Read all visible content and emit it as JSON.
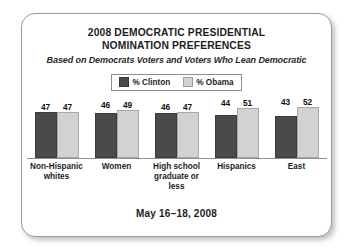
{
  "card": {
    "title_lines": [
      "2008 DEMOCRATIC PRESIDENTIAL",
      "NOMINATION PREFERENCES"
    ],
    "subtitle": "Based on Democrats Voters and Voters Who Lean Democratic",
    "footer": "May 16–18, 2008"
  },
  "legend": {
    "items": [
      {
        "label": "% Clinton",
        "color": "#4a4a4a",
        "swatch": "clinton-swatch"
      },
      {
        "label": "% Obama",
        "color": "#d2d2d2",
        "swatch": "obama-swatch"
      }
    ]
  },
  "colors": {
    "clinton": "#4a4a4a",
    "obama": "#d2d2d2",
    "axis": "#8f8f8f",
    "card_border": "#9a9a9a",
    "background": "#ffffff",
    "text": "#1d1d1d"
  },
  "chart_data": {
    "type": "bar",
    "title": "2008 DEMOCRATIC PRESIDENTIAL NOMINATION PREFERENCES",
    "subtitle": "Based on Democrats Voters and Voters Who Lean Democratic",
    "xlabel": "",
    "ylabel": "",
    "ylim": [
      0,
      60
    ],
    "grid": false,
    "legend_position": "top-center",
    "data_labels": true,
    "categories": [
      "Non-Hispanic whites",
      "Women",
      "High school graduate or less",
      "Hispanics",
      "East"
    ],
    "category_lines": [
      [
        "Non-Hispanic",
        "whites"
      ],
      [
        "Women",
        ""
      ],
      [
        "High school",
        "graduate or less"
      ],
      [
        "Hispanics",
        ""
      ],
      [
        "East",
        ""
      ]
    ],
    "series": [
      {
        "name": "% Clinton",
        "color": "#4a4a4a",
        "values": [
          47,
          46,
          46,
          44,
          43
        ]
      },
      {
        "name": "% Obama",
        "color": "#d2d2d2",
        "values": [
          47,
          49,
          47,
          51,
          52
        ]
      }
    ],
    "note": "May 16–18, 2008"
  }
}
